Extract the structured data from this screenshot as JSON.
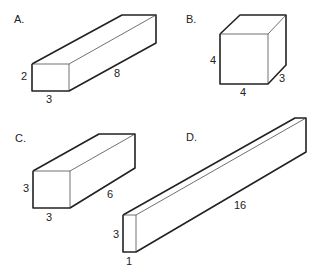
{
  "figures": [
    {
      "id": "A",
      "label": "A.",
      "dims": {
        "height": "2",
        "width": "3",
        "length": "8"
      },
      "front": [
        [
          32,
          64
        ],
        [
          69,
          64
        ],
        [
          69,
          91
        ],
        [
          32,
          91
        ]
      ],
      "back_tl": [
        122,
        15
      ],
      "back_tr": [
        156,
        15
      ],
      "back_br": [
        156,
        43
      ],
      "label_pos": [
        14,
        23
      ],
      "dim_pos": {
        "height": [
          21,
          80
        ],
        "width": [
          46,
          103
        ],
        "length": [
          114,
          77
        ]
      }
    },
    {
      "id": "B",
      "label": "B.",
      "dims": {
        "height": "4",
        "width": "4",
        "depth": "3"
      },
      "front": [
        [
          220,
          34
        ],
        [
          268,
          34
        ],
        [
          268,
          84
        ],
        [
          220,
          84
        ]
      ],
      "back_tl": [
        240,
        15
      ],
      "back_tr": [
        286,
        15
      ],
      "back_br": [
        286,
        65
      ],
      "label_pos": [
        186,
        23
      ],
      "dim_pos": {
        "height": [
          210,
          64
        ],
        "width": [
          240,
          96
        ],
        "depth": [
          279,
          82
        ]
      }
    },
    {
      "id": "C",
      "label": "C.",
      "dims": {
        "height": "3",
        "width": "3",
        "length": "6"
      },
      "front": [
        [
          33,
          171
        ],
        [
          70,
          171
        ],
        [
          70,
          208
        ],
        [
          33,
          208
        ]
      ],
      "back_tl": [
        99,
        134
      ],
      "back_tr": [
        135,
        134
      ],
      "back_br": [
        135,
        168
      ],
      "label_pos": [
        15,
        142
      ],
      "dim_pos": {
        "height": [
          23,
          192
        ],
        "width": [
          46,
          221
        ],
        "length": [
          107,
          198
        ]
      }
    },
    {
      "id": "D",
      "label": "D.",
      "dims": {
        "height": "3",
        "width": "1",
        "length": "16"
      },
      "front": [
        [
          123,
          215
        ],
        [
          136,
          215
        ],
        [
          136,
          252
        ],
        [
          123,
          252
        ]
      ],
      "back_tl": [
        295,
        118
      ],
      "back_tr": [
        306,
        118
      ],
      "back_br": [
        306,
        152
      ],
      "label_pos": [
        186,
        141
      ],
      "dim_pos": {
        "height": [
          113,
          238
        ],
        "width": [
          126,
          265
        ],
        "length": [
          234,
          209
        ]
      }
    }
  ]
}
